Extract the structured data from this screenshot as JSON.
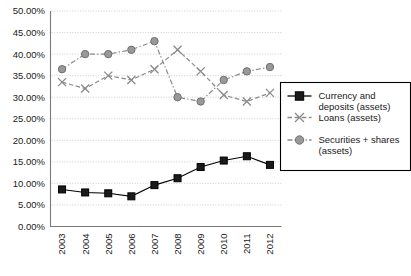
{
  "chart_data": {
    "type": "line",
    "title": "",
    "subtitle": "",
    "xlabel": "",
    "ylabel": "",
    "x": [
      "2003",
      "2004",
      "2005",
      "2006",
      "2007",
      "2008",
      "2009",
      "2010",
      "2011",
      "2012"
    ],
    "categories": [
      "2003",
      "2004",
      "2005",
      "2006",
      "2007",
      "2008",
      "2009",
      "2010",
      "2011",
      "2012"
    ],
    "ylim": [
      0,
      50
    ],
    "ytick_step": 5,
    "ytick_labels": [
      "0.00%",
      "5.00%",
      "10.00%",
      "15.00%",
      "20.00%",
      "25.00%",
      "30.00%",
      "35.00%",
      "40.00%",
      "45.00%",
      "50.00%"
    ],
    "ytick_values": [
      0,
      5,
      10,
      15,
      20,
      25,
      30,
      35,
      40,
      45,
      50
    ],
    "grid": true,
    "grid_axis": "y",
    "legend_position": "right-middle",
    "value_suffix": "%",
    "series": [
      {
        "name": "Currency and deposits (assets)",
        "marker": "square",
        "color": "#000000",
        "marker_fill": "#1a1a1a",
        "line_style": "solid",
        "values": [
          8.6,
          7.9,
          7.7,
          7.0,
          9.6,
          11.2,
          13.8,
          15.3,
          16.3,
          14.3
        ]
      },
      {
        "name": "Loans (assets)",
        "marker": "x",
        "color": "#8a8a8a",
        "marker_fill": "none",
        "line_style": "dashed",
        "values": [
          33.5,
          32.0,
          35.0,
          34.0,
          36.5,
          41.0,
          36.0,
          30.5,
          29.0,
          31.0
        ]
      },
      {
        "name": "Securities + shares (assets)",
        "marker": "circle",
        "color": "#8a8a8a",
        "marker_fill": "#999999",
        "line_style": "dashdot",
        "values": [
          36.5,
          40.0,
          40.0,
          41.0,
          43.0,
          30.0,
          29.0,
          34.0,
          36.0,
          37.0
        ]
      }
    ]
  },
  "legend": {
    "entries": [
      {
        "label_line1": "Currency and",
        "label_line2": "deposits (assets)",
        "full": "Currency and deposits (assets)"
      },
      {
        "label_line1": "Loans (assets)",
        "label_line2": "",
        "full": "Loans (assets)"
      },
      {
        "label_line1": "Securities + shares",
        "label_line2": "(assets)",
        "full": "Securities + shares (assets)"
      }
    ]
  },
  "colors": {
    "series_currency": "#000000",
    "series_loans": "#8a8a8a",
    "series_securities": "#999999",
    "gridline": "#c9c9c9",
    "frame": "#7a7a7a",
    "text": "#1a1a1a",
    "background": "#ffffff"
  }
}
